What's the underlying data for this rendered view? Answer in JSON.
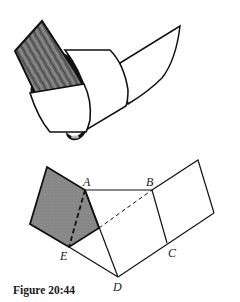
{
  "figure": {
    "caption": "Figure 20:44",
    "colors": {
      "line": "#111111",
      "shaded_face": "#8c8c8c",
      "board_fill": "#6e6e6e",
      "background": "#ffffff"
    },
    "top_illustration": {
      "description": "Curved strip of card wrapped around a cylinder with a wooden board inserted and a tail flap extending to the right"
    },
    "net_diagram": {
      "vertex_labels": {
        "A": "A",
        "B": "B",
        "C": "C",
        "D": "D",
        "E": "E"
      },
      "shaded_region": "pentagon face folded about line AE (dashed)",
      "dashed_lines": [
        "A–E",
        "fold line from AD to B"
      ]
    }
  }
}
